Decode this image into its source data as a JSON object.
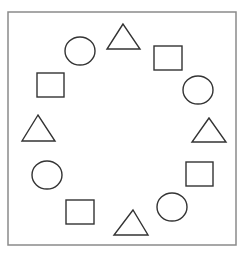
{
  "diagram": {
    "frame": {
      "x": 8,
      "y": 12,
      "width": 228,
      "height": 233,
      "stroke": "#8a8a8a",
      "stroke_width": 1.5
    },
    "stroke_color": "#333333",
    "stroke_width": 1.4,
    "shapes": [
      {
        "type": "circle",
        "cx": 80,
        "cy": 51,
        "rx": 15,
        "ry": 14
      },
      {
        "type": "triangle",
        "points": "123,24 107,49 140,49"
      },
      {
        "type": "square",
        "x": 154,
        "y": 46,
        "w": 28,
        "h": 24
      },
      {
        "type": "circle",
        "cx": 198,
        "cy": 90,
        "rx": 15,
        "ry": 14
      },
      {
        "type": "triangle",
        "points": "209,118 192,142 226,142"
      },
      {
        "type": "square",
        "x": 186,
        "y": 162,
        "w": 27,
        "h": 24
      },
      {
        "type": "circle",
        "cx": 172,
        "cy": 207,
        "rx": 15,
        "ry": 14
      },
      {
        "type": "triangle",
        "points": "133,210 114,235 148,235"
      },
      {
        "type": "square",
        "x": 66,
        "y": 200,
        "w": 28,
        "h": 24
      },
      {
        "type": "circle",
        "cx": 47,
        "cy": 175,
        "rx": 15,
        "ry": 14
      },
      {
        "type": "triangle",
        "points": "38,115 22,141 55,141"
      },
      {
        "type": "square",
        "x": 37,
        "y": 73,
        "w": 27,
        "h": 24
      }
    ]
  }
}
